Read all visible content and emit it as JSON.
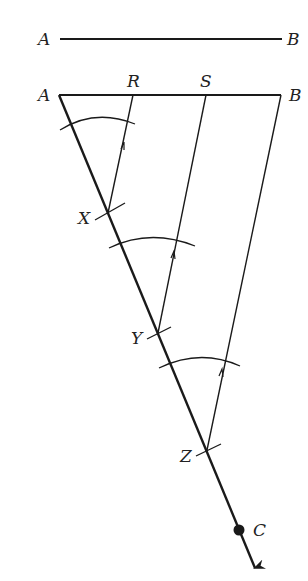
{
  "diagram": {
    "type": "geometric-construction",
    "labels": {
      "top_a": "A",
      "top_b": "B",
      "a": "A",
      "r": "R",
      "s": "S",
      "b": "B",
      "x": "X",
      "y": "Y",
      "z": "Z",
      "c": "C"
    },
    "colors": {
      "stroke": "#1a1a1a",
      "background": "#ffffff"
    }
  }
}
